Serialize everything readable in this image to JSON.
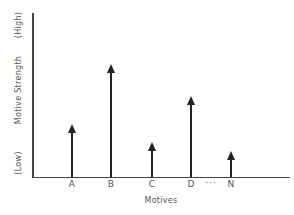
{
  "chart_data": {
    "type": "bar",
    "style": "arrow-stems",
    "title": "",
    "xlabel": "Motives",
    "ylabel": "Motive Strength",
    "y_low_label": "(Low)",
    "y_high_label": "(High)",
    "categories": [
      "A",
      "B",
      "C",
      "D",
      "N"
    ],
    "ellipsis": "...",
    "values": [
      0.32,
      0.68,
      0.21,
      0.49,
      0.15
    ],
    "ylim": [
      0,
      1
    ],
    "grid": false,
    "legend": null,
    "y_tick_numbers_shown": false
  },
  "labels": {
    "categories": [
      "A",
      "B",
      "C",
      "D",
      "N"
    ],
    "ellipsis": "···",
    "xtitle": "Motives",
    "ytitle": "Motive Strength",
    "ylow": "(Low)",
    "yhigh": "(High)"
  }
}
